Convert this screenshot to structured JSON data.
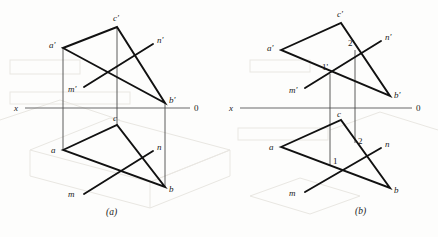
{
  "figure": {
    "caption_a": "(a)",
    "caption_b": "(b)",
    "axis_label_left": "x",
    "axis_label_right": "0"
  },
  "diagram_a": {
    "name": "projection-diagram-a",
    "axis": {
      "label_left": "x",
      "label_right": "0",
      "y": 108,
      "x1": 25,
      "x2": 190
    },
    "frontal_view": {
      "vertices": [
        {
          "id": "a-prime",
          "label": "a'",
          "x": 63,
          "y": 48,
          "label_x": 49,
          "label_y": 45
        },
        {
          "id": "c-prime",
          "label": "c'",
          "x": 117,
          "y": 27,
          "label_x": 113,
          "label_y": 18
        },
        {
          "id": "b-prime",
          "label": "b'",
          "x": 165,
          "y": 103,
          "label_x": 169,
          "label_y": 100
        }
      ],
      "line_m_n": {
        "m_label": "m'",
        "n_label": "n'",
        "m_x": 84,
        "m_y": 87,
        "m_label_x": 71,
        "m_label_y": 90,
        "n_x": 153,
        "n_y": 44,
        "n_label_x": 157,
        "n_label_y": 41
      }
    },
    "horizontal_view": {
      "vertices": [
        {
          "id": "a",
          "label": "a",
          "x": 63,
          "y": 150,
          "label_x": 51,
          "label_y": 150
        },
        {
          "id": "c",
          "label": "c",
          "x": 117,
          "y": 125,
          "label_x": 113,
          "label_y": 120
        },
        {
          "id": "b",
          "label": "b",
          "x": 165,
          "y": 187,
          "label_x": 169,
          "label_y": 190
        }
      ],
      "line_m_n": {
        "m_label": "m",
        "n_label": "n",
        "m_x": 84,
        "m_y": 194,
        "m_label_x": 71,
        "m_label_y": 194,
        "n_x": 153,
        "n_y": 151,
        "n_label_x": 157,
        "n_label_y": 148
      }
    },
    "projection_lines": [
      {
        "x": 63,
        "y1": 48,
        "y2": 150
      },
      {
        "x": 117,
        "y1": 27,
        "y2": 125
      },
      {
        "x": 165,
        "y1": 103,
        "y2": 187
      }
    ]
  },
  "diagram_b": {
    "name": "projection-diagram-b",
    "axis": {
      "label_left": "x",
      "label_right": "0",
      "y": 108,
      "x1": 240,
      "x2": 412
    },
    "frontal_view": {
      "vertices": [
        {
          "id": "a-prime",
          "label": "a'",
          "x": 281,
          "y": 50,
          "label_x": 267,
          "label_y": 47
        },
        {
          "id": "c-prime",
          "label": "c'",
          "x": 341,
          "y": 23,
          "label_x": 337,
          "label_y": 15
        },
        {
          "id": "b-prime",
          "label": "b'",
          "x": 390,
          "y": 96,
          "label_x": 394,
          "label_y": 95
        }
      ],
      "line_m_n": {
        "m_label": "m'",
        "n_label": "n'",
        "m_x": 305,
        "m_y": 88,
        "m_label_x": 292,
        "m_label_y": 92,
        "n_x": 381,
        "n_y": 41,
        "n_label_x": 385,
        "n_label_y": 38
      },
      "intersection_points": [
        {
          "id": "point-1-prime",
          "label": "1'",
          "x": 330,
          "y": 74,
          "label_x": 324,
          "label_y": 68
        },
        {
          "id": "point-2-prime",
          "label": "2'",
          "x": 355,
          "y": 50,
          "label_x": 350,
          "label_y": 44
        }
      ]
    },
    "horizontal_view": {
      "vertices": [
        {
          "id": "a",
          "label": "a",
          "x": 281,
          "y": 147,
          "label_x": 269,
          "label_y": 147
        },
        {
          "id": "c",
          "label": "c",
          "x": 341,
          "y": 120,
          "label_x": 337,
          "label_y": 115
        },
        {
          "id": "b",
          "label": "b",
          "x": 390,
          "y": 188,
          "label_x": 394,
          "label_y": 190
        }
      ],
      "line_m_n": {
        "m_label": "m",
        "n_label": "n",
        "m_x": 305,
        "m_y": 192,
        "m_label_x": 292,
        "m_label_y": 193,
        "n_x": 381,
        "n_y": 148,
        "n_label_x": 385,
        "n_label_y": 145
      },
      "intersection_points": [
        {
          "id": "point-1",
          "label": "1",
          "x": 330,
          "y": 166,
          "label_x": 334,
          "label_y": 164
        },
        {
          "id": "point-2",
          "label": "2",
          "x": 355,
          "y": 143,
          "label_x": 359,
          "label_y": 143
        }
      ]
    },
    "projection_lines": [
      {
        "x": 330,
        "y1": 74,
        "y2": 166
      },
      {
        "x": 355,
        "y1": 50,
        "y2": 143
      }
    ]
  },
  "colors": {
    "ink": "#111111",
    "axis": "#6a6a6a",
    "projection": "#4a4a4a",
    "background": "#fdfdfc",
    "ghost": "#e9e7e2"
  }
}
